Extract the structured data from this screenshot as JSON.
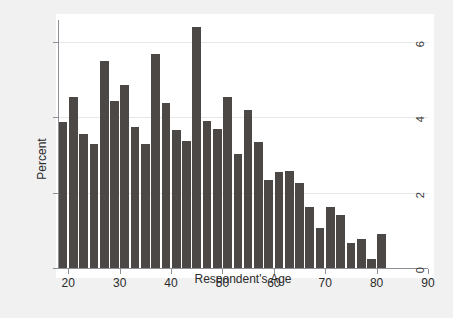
{
  "chart_data": {
    "type": "bar",
    "title": "",
    "subtitle": "",
    "xlabel": "Respondent's Age",
    "ylabel": "Percent",
    "xlim": [
      18,
      90
    ],
    "ylim": [
      0,
      6.6
    ],
    "grid": true,
    "legend": null,
    "bar_color": "#4b4846",
    "background_color": "#f1f1f1",
    "plot_background_color": "#ffffff",
    "bin_width": 2,
    "x_ticks": [
      20,
      30,
      40,
      50,
      60,
      70,
      80,
      90
    ],
    "y_ticks": [
      0,
      2,
      4,
      6
    ],
    "x_tick_labels": [
      "20",
      "30",
      "40",
      "50",
      "60",
      "70",
      "80",
      "90"
    ],
    "y_tick_labels": [
      "0",
      "2",
      "4",
      "6"
    ],
    "categories": [
      "18-20",
      "20-22",
      "22-24",
      "24-26",
      "26-28",
      "28-30",
      "30-32",
      "32-34",
      "34-36",
      "36-38",
      "38-40",
      "40-42",
      "42-44",
      "44-46",
      "46-48",
      "48-50",
      "50-52",
      "52-54",
      "54-56",
      "56-58",
      "58-60",
      "60-62",
      "62-64",
      "64-66",
      "66-68",
      "68-70",
      "70-72",
      "72-74",
      "74-76",
      "76-78",
      "78-80",
      "80-82",
      "82-84",
      "84-86",
      "86-88",
      "88-90"
    ],
    "bin_starts": [
      18,
      20,
      22,
      24,
      26,
      28,
      30,
      32,
      34,
      36,
      38,
      40,
      42,
      44,
      46,
      48,
      50,
      52,
      54,
      56,
      58,
      60,
      62,
      64,
      66,
      68,
      70,
      72,
      74,
      76,
      78,
      80,
      82,
      84,
      86,
      88
    ],
    "values": [
      3.88,
      4.52,
      3.54,
      3.3,
      5.48,
      4.42,
      4.86,
      3.74,
      3.3,
      5.68,
      4.38,
      3.66,
      3.36,
      6.38,
      3.9,
      3.68,
      4.52,
      3.02,
      4.2,
      3.34,
      2.32,
      2.54,
      2.58,
      2.26,
      1.62,
      1.06,
      1.62,
      1.4,
      0.66,
      0.78,
      0.24,
      0.9,
      0.0,
      0.0,
      0.0,
      0.0
    ]
  }
}
